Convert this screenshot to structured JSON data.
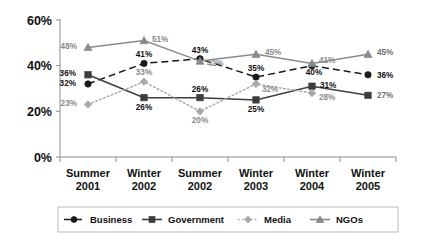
{
  "chart_data": {
    "type": "line",
    "title": "",
    "subtitle": "",
    "xlabel": "",
    "ylabel": "",
    "ylim": [
      0,
      60
    ],
    "yticks": [
      "0%",
      "20%",
      "40%",
      "60%"
    ],
    "ytick_values": [
      0,
      20,
      40,
      60
    ],
    "grid": false,
    "legend_position": "bottom",
    "categories": [
      "Summer\n2001",
      "Winter\n2002",
      "Summer\n2002",
      "Winter\n2003",
      "Winter\n2004",
      "Winter\n2005"
    ],
    "category_lines": [
      [
        "Summer",
        "2001"
      ],
      [
        "Winter",
        "2002"
      ],
      [
        "Summer",
        "2002"
      ],
      [
        "Winter",
        "2003"
      ],
      [
        "Winter",
        "2004"
      ],
      [
        "Winter",
        "2005"
      ]
    ],
    "series": [
      {
        "name": "Business",
        "marker": "circle",
        "line_style": "dashed",
        "color": "#1a1a1a",
        "values": [
          32,
          41,
          43,
          35,
          40,
          36
        ],
        "labels": [
          "32%",
          "41%",
          "43%",
          "35%",
          "40%",
          "36%"
        ]
      },
      {
        "name": "Government",
        "marker": "square",
        "line_style": "solid",
        "color": "#3d3d3d",
        "values": [
          36,
          26,
          26,
          25,
          31,
          27
        ],
        "labels": [
          "36%",
          "26%",
          "26%",
          "25%",
          "31%",
          "27%"
        ]
      },
      {
        "name": "Media",
        "marker": "diamond",
        "line_style": "dotted",
        "color": "#a8a8a8",
        "values": [
          23,
          33,
          20,
          32,
          28,
          null
        ],
        "labels": [
          "23%",
          "33%",
          "20%",
          "32%",
          "28%",
          null
        ]
      },
      {
        "name": "NGOs",
        "marker": "triangle",
        "line_style": "solid",
        "color": "#8a8a8a",
        "values": [
          48,
          51,
          42,
          45,
          41,
          45
        ],
        "labels": [
          "48%",
          "51%",
          "42%",
          "45%",
          "41%",
          "45%"
        ]
      }
    ]
  },
  "legend": {
    "items": [
      {
        "label": "Business"
      },
      {
        "label": "Government"
      },
      {
        "label": "Media"
      },
      {
        "label": "NGOs"
      }
    ]
  },
  "axis": {
    "y_labels": [
      "60%",
      "40%",
      "20%",
      "0%"
    ]
  }
}
